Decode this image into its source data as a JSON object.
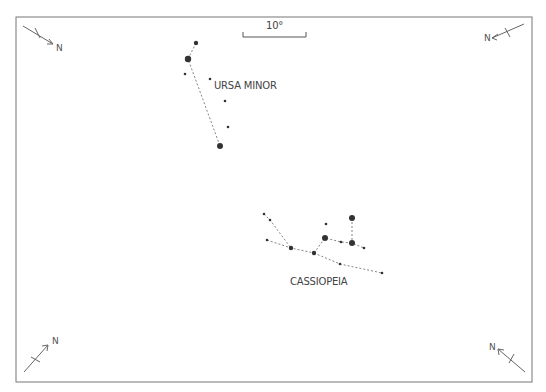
{
  "scale_bar": {
    "label": "10°"
  },
  "compass": {
    "north_label": "N"
  },
  "constellations": [
    {
      "name": "URSA MINOR",
      "stars": [
        {
          "x": 196,
          "y": 43,
          "r": 2.2
        },
        {
          "x": 188,
          "y": 59,
          "r": 3.2
        },
        {
          "x": 185,
          "y": 74,
          "r": 1.3
        },
        {
          "x": 210,
          "y": 79,
          "r": 1.3
        },
        {
          "x": 225,
          "y": 101,
          "r": 1.3
        },
        {
          "x": 228,
          "y": 127,
          "r": 1.3
        },
        {
          "x": 220,
          "y": 146,
          "r": 3.0
        }
      ],
      "lines": [
        [
          [
            196,
            43
          ],
          [
            188,
            59
          ],
          [
            220,
            146
          ]
        ]
      ]
    },
    {
      "name": "CASSIOPEIA",
      "stars": [
        {
          "x": 264,
          "y": 214,
          "r": 1.3
        },
        {
          "x": 270,
          "y": 220,
          "r": 1.3
        },
        {
          "x": 267,
          "y": 240,
          "r": 1.3
        },
        {
          "x": 291,
          "y": 248,
          "r": 2.2
        },
        {
          "x": 314,
          "y": 253,
          "r": 2.2
        },
        {
          "x": 326,
          "y": 224,
          "r": 1.3
        },
        {
          "x": 325,
          "y": 238,
          "r": 3.0
        },
        {
          "x": 341,
          "y": 242,
          "r": 1.3
        },
        {
          "x": 352,
          "y": 218,
          "r": 3.0
        },
        {
          "x": 352,
          "y": 243,
          "r": 3.0
        },
        {
          "x": 364,
          "y": 248,
          "r": 1.3
        },
        {
          "x": 340,
          "y": 264,
          "r": 1.3
        },
        {
          "x": 382,
          "y": 273,
          "r": 1.3
        }
      ],
      "lines": [
        [
          [
            264,
            214
          ],
          [
            270,
            220
          ],
          [
            291,
            248
          ]
        ],
        [
          [
            267,
            240
          ],
          [
            291,
            248
          ],
          [
            314,
            253
          ]
        ],
        [
          [
            314,
            253
          ],
          [
            325,
            238
          ],
          [
            341,
            242
          ],
          [
            352,
            243
          ],
          [
            364,
            248
          ]
        ],
        [
          [
            352,
            218
          ],
          [
            352,
            243
          ]
        ],
        [
          [
            314,
            253
          ],
          [
            340,
            264
          ],
          [
            382,
            273
          ]
        ]
      ]
    }
  ]
}
